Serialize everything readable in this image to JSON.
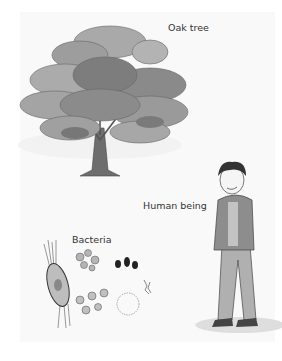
{
  "labels": {
    "oak_tree": "Oak tree",
    "human_being": "Human being",
    "bacteria": "Bacteria"
  },
  "colors": {
    "background": "#f9f9f9",
    "foliage_light": "#a9a9a9",
    "foliage_dark": "#7d7d7d",
    "trunk": "#6e6e6e",
    "text": "#333333"
  }
}
